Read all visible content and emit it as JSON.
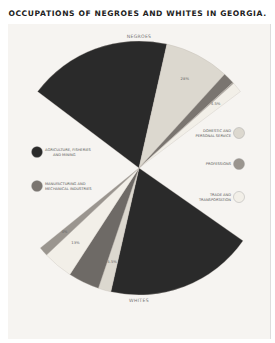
{
  "chart_data": {
    "type": "pie",
    "title": "OCCUPATIONS OF NEGROES AND WHITES IN GEORGIA.",
    "groups": [
      {
        "name": "NEGROES",
        "position": "top",
        "slices": [
          {
            "category": "Agriculture, Fisheries and Mining",
            "value": 62,
            "color": "#2a2a2a"
          },
          {
            "category": "Domestic and Personal Service",
            "value": 28,
            "color": "#dcd8cf",
            "label": "28%"
          },
          {
            "category": "Manufacturing and Mechanical Industries",
            "value": 5,
            "color": "#7a7570"
          },
          {
            "category": "Professions",
            "value": 0.5,
            "color": "#a8a39c"
          },
          {
            "category": "Trade and Transportation",
            "value": 4.5,
            "color": "#f2efe8",
            "label": "4.5%"
          }
        ]
      },
      {
        "name": "WHITES",
        "position": "bottom",
        "slices": [
          {
            "category": "Agriculture, Fisheries and Mining",
            "value": 64,
            "color": "#2a2a2a"
          },
          {
            "category": "Domestic and Personal Service",
            "value": 5.5,
            "color": "#dcd8cf",
            "label": "5.5%"
          },
          {
            "category": "Manufacturing and Mechanical Industries",
            "value": 13.5,
            "color": "#6e6a66"
          },
          {
            "category": "Trade and Transportation",
            "value": 13,
            "color": "#f2efe8",
            "label": "13%"
          },
          {
            "category": "Professions",
            "value": 4,
            "color": "#9a958f",
            "label": "4%"
          }
        ]
      }
    ],
    "legend": {
      "placement": "sides",
      "left": [
        {
          "label_lines": [
            "AGRICULTURE, FISHERIES",
            "AND MINING"
          ],
          "color": "#2a2a2a"
        },
        {
          "label_lines": [
            "MANUFACTURING AND",
            "MECHANICAL INDUSTRIES"
          ],
          "color": "#7a7570"
        }
      ],
      "right": [
        {
          "label_lines": [
            "DOMESTIC AND",
            "PERSONAL SERVICE"
          ],
          "color": "#dcd8cf"
        },
        {
          "label_lines": [
            "PROFESSIONS"
          ],
          "color": "#9a958f"
        },
        {
          "label_lines": [
            "TRADE AND",
            "TRANSPORTATION"
          ],
          "color": "#f2efe8"
        }
      ]
    }
  }
}
